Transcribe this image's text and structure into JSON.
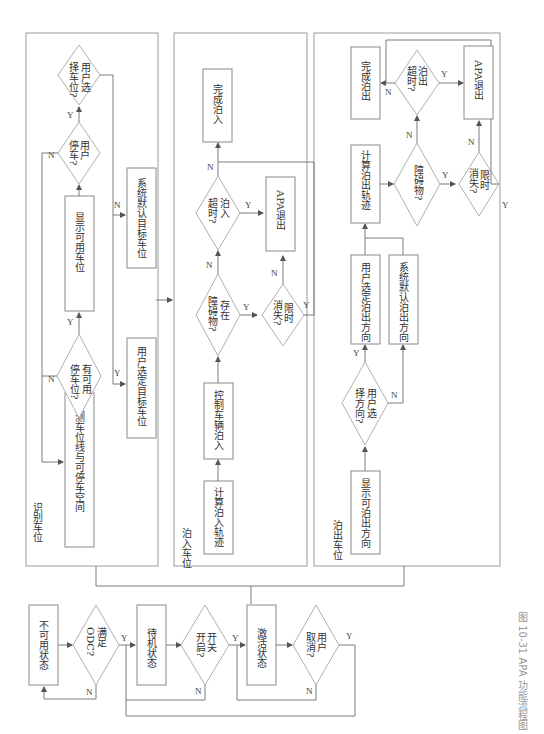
{
  "caption": "图 10-31  APA 功能流程图",
  "states": {
    "unavailable": "不可用状态",
    "odc_q": "满足ODC?",
    "odc_q1": "满足",
    "odc_q2": "ODC?",
    "standby": "待机状态",
    "switch_q1": "开关",
    "switch_q2": "开启?",
    "active": "激活状态",
    "cancel_q1": "用户",
    "cancel_q2": "取消?"
  },
  "panel_identify": {
    "title": "识别车位",
    "detect": "检测车位线与可停车空间",
    "has_spot_q1": "有可用",
    "has_spot_q2": "停车位?",
    "show_spots": "显示可用车位",
    "user_park_q1": "用户",
    "user_park_q2": "停车?",
    "user_select_q1": "用户选",
    "user_select_q2": "择车位?",
    "user_selected": "用户选定目标车位",
    "system_default": "系统默认目标车位"
  },
  "panel_park_in": {
    "title": "泊入车位",
    "calc": "计算泊入轨迹",
    "control": "控制车辆泊入",
    "obstacle_q1": "存在",
    "obstacle_q2": "障碍物?",
    "timeout_disappear_q1": "限时",
    "timeout_disappear_q2": "消失?",
    "park_timeout_q1": "泊入",
    "park_timeout_q2": "超时?",
    "apa_exit": "APA退出",
    "complete": "完成泊入"
  },
  "panel_park_out": {
    "title": "泊出车位",
    "show_dirs": "显示可泊出方向",
    "user_dir_q1": "用户选",
    "user_dir_q2": "择方向?",
    "user_dir": "用户选定泊出方向",
    "system_dir": "系统默认泊出方向",
    "calc": "计算泊出轨迹",
    "obstacle_q": "障碍物?",
    "timeout_disappear_q1": "限时",
    "timeout_disappear_q2": "消失?",
    "out_timeout_q1": "泊出",
    "out_timeout_q2": "超时?",
    "apa_exit": "APA退出",
    "complete": "完成泊出"
  },
  "labels": {
    "yes": "Y",
    "no": "N"
  }
}
